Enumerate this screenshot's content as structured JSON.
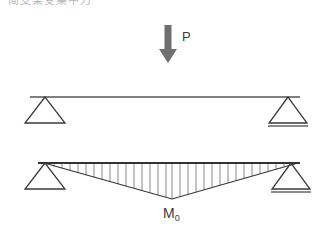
{
  "figure": {
    "title_fragment": "简支梁受集中力",
    "background_color": "#ffffff",
    "width": 333,
    "height": 234
  },
  "labels": {
    "load": "P",
    "moment": "M",
    "moment_subscript": "0"
  },
  "colors": {
    "load_arrow": "#6f6f6f",
    "beam_line": "#555555",
    "support_line": "#3a3a3a",
    "diagram_outline": "#333333",
    "hatch_line": "#6a6a6a",
    "ground_line": "#666666",
    "text": "#3a3a3a"
  },
  "beam_diagram": {
    "name": "simply-supported-beam",
    "beam_y": 97,
    "beam_x_start": 30,
    "beam_x_end": 300,
    "left_support": {
      "type": "pin",
      "x": 45,
      "y": 97,
      "half_width": 20,
      "height": 26
    },
    "right_support": {
      "type": "roller",
      "x": 288,
      "y": 97,
      "half_width": 19,
      "height": 26,
      "ground_y": 126
    },
    "point_load": {
      "label": "P",
      "x": 168,
      "y_start": 25,
      "y_end": 63,
      "shaft_width": 7,
      "head_width": 18,
      "head_height": 14,
      "label_x": 182,
      "label_y": 37
    }
  },
  "moment_diagram": {
    "name": "bending-moment-diagram",
    "baseline_y": 163,
    "x_start": 38,
    "x_end": 300,
    "peak_x": 172,
    "peak_y": 199,
    "hatch_count": 30,
    "left_support": {
      "type": "pin",
      "x": 45,
      "y": 163,
      "half_width": 20,
      "height": 26
    },
    "right_support": {
      "type": "roller",
      "x": 291,
      "y": 163,
      "half_width": 19,
      "height": 26,
      "ground_y": 192
    },
    "label": {
      "text": "M",
      "subscript": "0",
      "x": 163,
      "y": 217
    }
  }
}
